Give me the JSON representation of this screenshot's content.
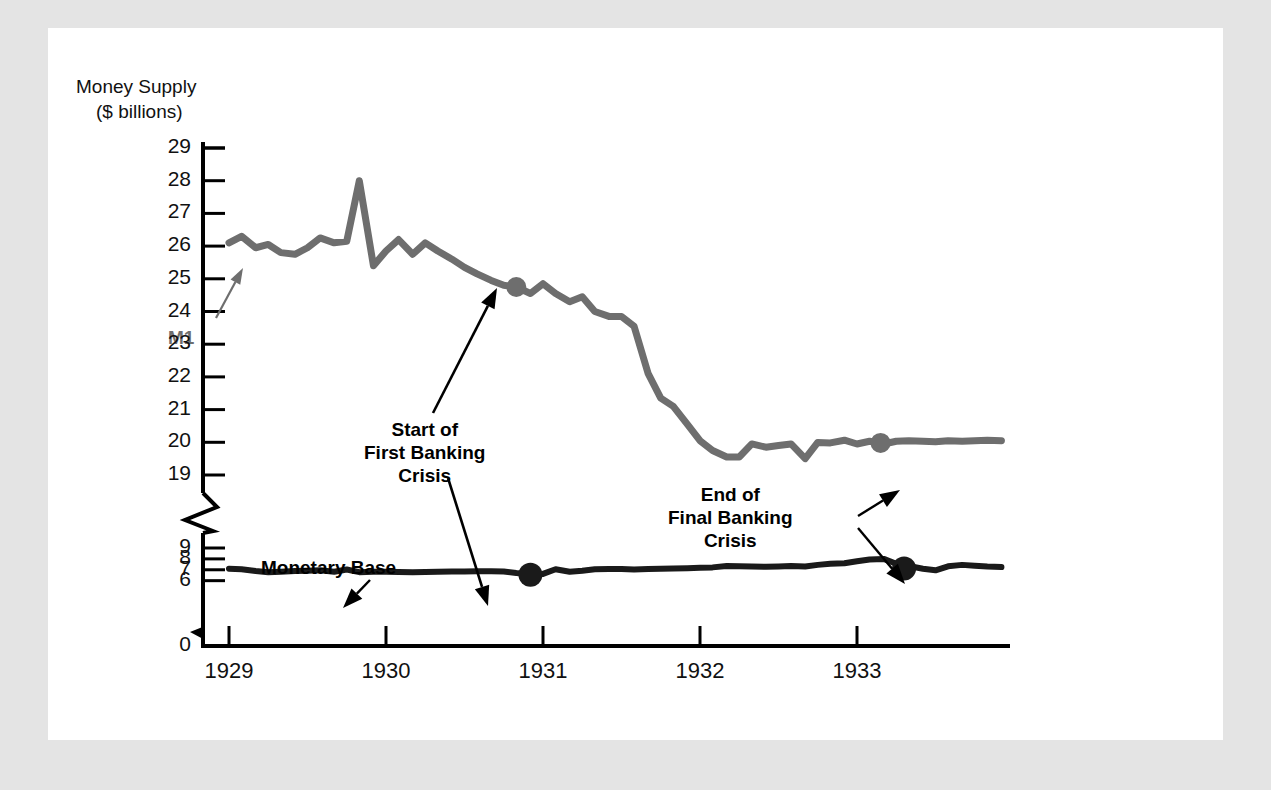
{
  "figure": {
    "background": "#ffffff",
    "frame_color": "#e4e4e4",
    "axis_title_line1": "Money Supply",
    "axis_title_line2": "($ billions)"
  },
  "colors": {
    "m1_line": "#6e6e6e",
    "monetary_base_line": "#1a1a1a",
    "axis": "#000000",
    "text": "#111111"
  },
  "annotations": {
    "m1": "M1",
    "monetary_base": "Monetary Base",
    "start_crisis": "Start of\nFirst Banking\nCrisis",
    "end_crisis": "End of\nFinal Banking\nCrisis"
  },
  "chart_data": {
    "type": "line",
    "title": "Money Supply ($ billions)",
    "xlabel": "",
    "ylabel": "Money Supply ($ billions)",
    "grid": false,
    "legend": "inline-labels",
    "axis_break": {
      "between": [
        19,
        9
      ],
      "note": "y-axis broken between 19 and 9"
    },
    "ytick_labels": [
      "29",
      "28",
      "27",
      "26",
      "25",
      "24",
      "23",
      "22",
      "21",
      "20",
      "19",
      "9",
      "8",
      "7",
      "6",
      "0"
    ],
    "ylim_upper_segment": [
      19,
      29
    ],
    "ylim_lower_segment": [
      0,
      9
    ],
    "xtick_labels": [
      "1929",
      "1930",
      "1931",
      "1932",
      "1933"
    ],
    "xlim": [
      1929.0,
      1934.0
    ],
    "series": [
      {
        "name": "M1",
        "color": "#6e6e6e",
        "x": [
          1929.0,
          1929.08,
          1929.17,
          1929.25,
          1929.33,
          1929.42,
          1929.5,
          1929.58,
          1929.67,
          1929.75,
          1929.83,
          1929.92,
          1930.0,
          1930.08,
          1930.17,
          1930.25,
          1930.33,
          1930.42,
          1930.5,
          1930.58,
          1930.67,
          1930.75,
          1930.83,
          1930.92,
          1931.0,
          1931.08,
          1931.17,
          1931.25,
          1931.33,
          1931.42,
          1931.5,
          1931.58,
          1931.67,
          1931.75,
          1931.83,
          1931.92,
          1932.0,
          1932.08,
          1932.17,
          1932.25,
          1932.33,
          1932.42,
          1932.5,
          1932.58,
          1932.67,
          1932.75,
          1932.83,
          1932.92,
          1933.0,
          1933.08,
          1933.17,
          1933.25,
          1933.33,
          1933.42,
          1933.5,
          1933.58,
          1933.67,
          1933.75,
          1933.83,
          1933.92
        ],
        "y": [
          26.1,
          26.3,
          25.95,
          26.05,
          25.8,
          25.75,
          25.95,
          26.25,
          26.1,
          26.15,
          28.0,
          25.4,
          25.85,
          26.2,
          25.75,
          26.1,
          25.85,
          25.6,
          25.35,
          25.15,
          24.95,
          24.8,
          24.75,
          24.55,
          24.85,
          24.55,
          24.3,
          24.45,
          24.0,
          23.85,
          23.85,
          23.55,
          22.1,
          21.35,
          21.1,
          20.55,
          20.05,
          19.75,
          19.55,
          19.55,
          19.95,
          19.85,
          19.9,
          19.95,
          19.5,
          18.7,
          18.65,
          18.9,
          18.55,
          18.8,
          18.55,
          18.8,
          18.85,
          18.8,
          18.75,
          18.85,
          18.8,
          18.85,
          18.9,
          18.85
        ],
        "markers": [
          {
            "x": 1930.83,
            "y": 24.75,
            "label": "Start of First Banking Crisis"
          },
          {
            "x": 1933.15,
            "y": 18.65,
            "label": "End of Final Banking Crisis"
          }
        ]
      },
      {
        "name": "Monetary Base",
        "color": "#1a1a1a",
        "x": [
          1929.0,
          1929.08,
          1929.17,
          1929.25,
          1929.33,
          1929.42,
          1929.5,
          1929.58,
          1929.67,
          1929.75,
          1929.83,
          1929.92,
          1930.0,
          1930.08,
          1930.17,
          1930.25,
          1930.33,
          1930.42,
          1930.5,
          1930.58,
          1930.67,
          1930.75,
          1930.83,
          1930.92,
          1931.0,
          1931.08,
          1931.17,
          1931.25,
          1931.33,
          1931.42,
          1931.5,
          1931.58,
          1931.67,
          1931.75,
          1931.83,
          1931.92,
          1932.0,
          1932.08,
          1932.17,
          1932.25,
          1932.33,
          1932.42,
          1932.5,
          1932.58,
          1932.67,
          1932.75,
          1932.83,
          1932.92,
          1933.0,
          1933.08,
          1933.17,
          1933.25,
          1933.33,
          1933.42,
          1933.5,
          1933.58,
          1933.67,
          1933.75,
          1933.83,
          1933.92
        ],
        "y": [
          7.1,
          7.05,
          6.88,
          6.78,
          6.82,
          6.88,
          6.92,
          6.95,
          6.82,
          7.02,
          6.78,
          6.82,
          6.82,
          6.8,
          6.78,
          6.8,
          6.82,
          6.84,
          6.85,
          6.86,
          6.86,
          6.84,
          6.7,
          6.58,
          6.62,
          7.05,
          6.82,
          6.92,
          7.05,
          7.08,
          7.08,
          7.02,
          7.06,
          7.1,
          7.12,
          7.14,
          7.18,
          7.22,
          7.35,
          7.32,
          7.3,
          7.28,
          7.3,
          7.34,
          7.3,
          7.45,
          7.55,
          7.6,
          7.78,
          7.95,
          8.0,
          7.55,
          7.35,
          7.1,
          6.95,
          7.32,
          7.45,
          7.38,
          7.3,
          7.25
        ],
        "markers": [
          {
            "x": 1930.92,
            "y": 6.55,
            "label": "Start of First Banking Crisis"
          },
          {
            "x": 1933.3,
            "y": 7.12,
            "label": "End of Final Banking Crisis"
          }
        ]
      }
    ]
  }
}
